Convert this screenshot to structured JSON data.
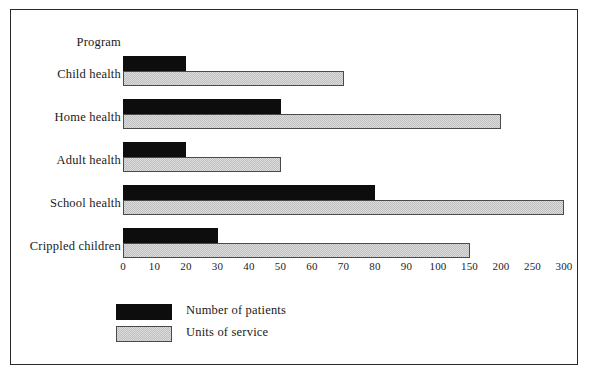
{
  "page": {
    "top_partial_text": "",
    "frame_color": "#2b2b2b",
    "background": "#ffffff"
  },
  "axis_header_label": "Program",
  "legend": {
    "items": [
      {
        "label": "Number of patients",
        "swatch": "black-swatch",
        "color": "#0d0d0d"
      },
      {
        "label": "Units of service",
        "swatch": "gray-hatch-swatch",
        "color": "#dcdcdc"
      }
    ]
  },
  "chart_data": {
    "type": "bar",
    "orientation": "horizontal",
    "title": "",
    "subtitle": "",
    "xlabel": "",
    "ylabel": "Program",
    "grid": false,
    "legend_position": "bottom-left",
    "categories": [
      "Child health",
      "Home health",
      "Adult health",
      "School health",
      "Crippled children"
    ],
    "series": [
      {
        "name": "Number of patients",
        "color": "#0d0d0d",
        "values": [
          20,
          50,
          20,
          80,
          30
        ]
      },
      {
        "name": "Units of service",
        "color": "#dcdcdc",
        "values": [
          70,
          200,
          50,
          300,
          150
        ]
      }
    ],
    "x_tick_labels": [
      "0",
      "10",
      "20",
      "30",
      "40",
      "50",
      "60",
      "70",
      "80",
      "90",
      "100",
      "150",
      "200",
      "250",
      "300"
    ],
    "x_tick_values": [
      0,
      10,
      20,
      30,
      40,
      50,
      60,
      70,
      80,
      90,
      100,
      150,
      200,
      250,
      300
    ],
    "x_scale_note": "broken / non-linear axis: equal spacing for 0-100 by 10, then 150, 200, 250, 300",
    "xlim": [
      0,
      300
    ]
  }
}
